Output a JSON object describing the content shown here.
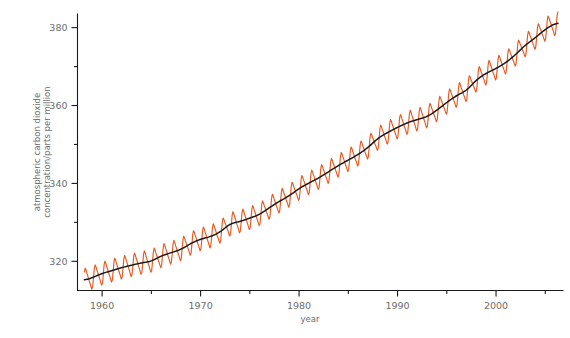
{
  "chart_data": {
    "type": "line",
    "title": "",
    "xlabel": "year",
    "ylabel": "atmospheric carbon dioxide concentration/parts per million",
    "ylabel_line1": "atmospheric carbon dioxide",
    "ylabel_line2": "concentration/parts per million",
    "xlim": [
      1957.5,
      2006.8
    ],
    "ylim": [
      312.5,
      383.5
    ],
    "grid": false,
    "legend": null,
    "x_major_ticks": [
      1960,
      1970,
      1980,
      1990,
      2000
    ],
    "x_major_tick_labels": [
      "1960",
      "1970",
      "1980",
      "1990",
      "2000"
    ],
    "x_minor_ticks": [
      1965,
      1975,
      1985,
      1995,
      2005
    ],
    "y_major_ticks": [
      320,
      340,
      360,
      380
    ],
    "y_major_tick_labels": [
      "320",
      "340",
      "360",
      "380"
    ],
    "y_minor_ticks": [
      330,
      350,
      370
    ],
    "colors": {
      "monthly_series": "#e8581f",
      "trend_series": "#1a1a1a",
      "axis": "#1a1a1a",
      "text": "#6d6d6d",
      "background": "#ffffff"
    },
    "seasonal_amplitude_ppm": 6.4,
    "series": [
      {
        "name": "monthly mean CO2",
        "color": "#e8581f",
        "note": "monthly values with seasonal sawtooth cycle superimposed on annual trend"
      },
      {
        "name": "seasonally adjusted trend",
        "color": "#1a1a1a",
        "x": [
          1958.2,
          1959,
          1960,
          1961,
          1962,
          1963,
          1964,
          1965,
          1966,
          1967,
          1968,
          1969,
          1970,
          1971,
          1972,
          1973,
          1974,
          1975,
          1976,
          1977,
          1978,
          1979,
          1980,
          1981,
          1982,
          1983,
          1984,
          1985,
          1986,
          1987,
          1988,
          1989,
          1990,
          1991,
          1992,
          1993,
          1994,
          1995,
          1996,
          1997,
          1998,
          1999,
          2000,
          2001,
          2002,
          2003,
          2004,
          2005,
          2006.3
        ],
        "values": [
          315.0,
          315.8,
          316.9,
          317.6,
          318.4,
          319.0,
          319.6,
          320.0,
          321.4,
          322.2,
          323.0,
          324.6,
          325.7,
          326.3,
          327.5,
          329.7,
          330.2,
          331.1,
          332.0,
          333.8,
          335.4,
          336.8,
          338.7,
          340.1,
          341.4,
          343.0,
          344.6,
          346.0,
          347.4,
          349.2,
          351.6,
          353.1,
          354.4,
          355.6,
          356.4,
          357.1,
          358.8,
          360.8,
          362.6,
          363.8,
          366.6,
          368.3,
          369.5,
          371.0,
          373.1,
          375.6,
          377.4,
          379.6,
          381.5
        ]
      }
    ]
  },
  "axis": {
    "x_title": "year",
    "y_title_line1": "atmospheric carbon dioxide",
    "y_title_line2": "concentration/parts per million"
  }
}
